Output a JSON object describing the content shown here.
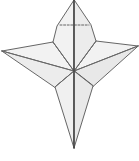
{
  "figure": {
    "kind": "shaded-wireframe-solid",
    "background_color": "#ffffff",
    "canvas": {
      "width": 139,
      "height": 161
    },
    "colors": {
      "facet_fill_light": "#f2f2f2",
      "facet_fill_mid": "#ececec",
      "facet_fill_dark": "#e4e4e4",
      "edge_stroke": "#6b6b6b",
      "silhouette_stroke": "#555555",
      "axis_stroke": "#4a4a4a",
      "dashed_stroke": "#555555"
    },
    "stroke_widths": {
      "edge": 0.8,
      "silhouette": 0.9,
      "axis": 1.6,
      "dashed": 0.9
    },
    "vertices": {
      "top_apex": [
        74,
        0
      ],
      "upper_left_shoulder": [
        53,
        42
      ],
      "upper_right_shoulder": [
        96,
        41
      ],
      "upper_left_waist": [
        57,
        26
      ],
      "upper_right_waist": [
        91,
        25
      ],
      "left_wing_tip": [
        2,
        51
      ],
      "right_wing_tip": [
        138,
        46
      ],
      "center_junction": [
        74,
        71
      ],
      "left_inner_notch": [
        55,
        62
      ],
      "right_inner_notch": [
        94,
        61
      ],
      "lower_left_vertex": [
        55,
        87
      ],
      "lower_right_vertex": [
        93,
        86
      ],
      "bottom_apex": [
        74,
        148
      ]
    },
    "facets": [
      {
        "name": "upper-lobe-left",
        "fill": "#f2f2f2"
      },
      {
        "name": "upper-lobe-right",
        "fill": "#ececec"
      },
      {
        "name": "left-wing-upper",
        "fill": "#f2f2f2"
      },
      {
        "name": "left-wing-lower",
        "fill": "#ececec"
      },
      {
        "name": "right-wing-upper",
        "fill": "#f2f2f2"
      },
      {
        "name": "right-wing-lower",
        "fill": "#e8e8e8"
      },
      {
        "name": "lower-spike-left",
        "fill": "#f0f0f0"
      },
      {
        "name": "lower-spike-right",
        "fill": "#e9e9e9"
      }
    ],
    "annotations": {
      "dashed_segment": {
        "name": "hidden-edge-dashed",
        "x1": 60,
        "y1": 25,
        "x2": 89,
        "y2": 25,
        "dash_pattern": "2,1.6"
      },
      "vertical_axis": {
        "name": "central-axis-line",
        "x1": 74,
        "y1": 0,
        "x2": 74,
        "y2": 148
      }
    }
  }
}
